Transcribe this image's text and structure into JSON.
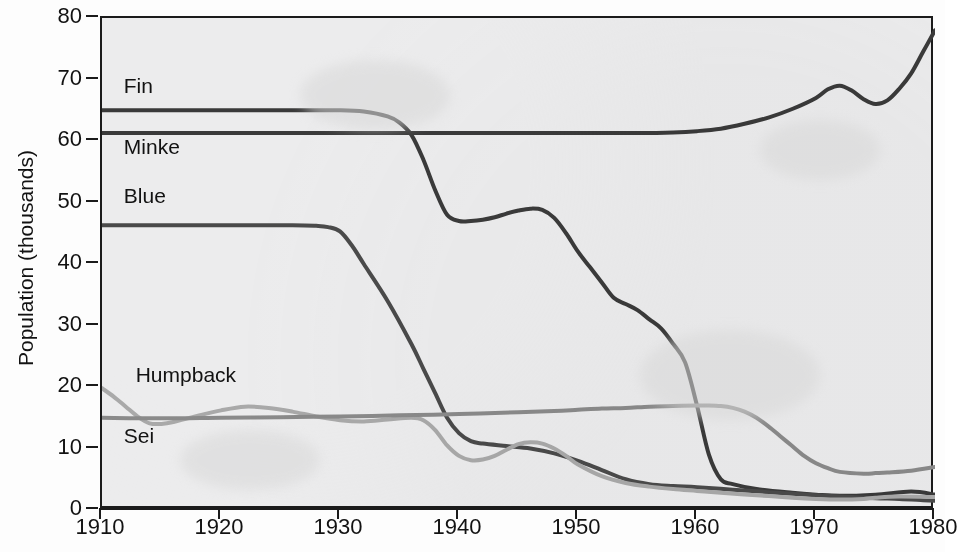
{
  "chart_data": {
    "type": "line",
    "title": "",
    "xlabel": "",
    "ylabel": "Population (thousands)",
    "xlim": [
      1910,
      1980
    ],
    "ylim": [
      0,
      80
    ],
    "xticks": [
      1910,
      1920,
      1930,
      1940,
      1950,
      1960,
      1970,
      1980
    ],
    "yticks": [
      0,
      10,
      20,
      30,
      40,
      50,
      60,
      70,
      80
    ],
    "grid": false,
    "legend": "inline-labels-left",
    "background": "#ececed",
    "series": [
      {
        "name": "Fin",
        "color": "#3a3a3a",
        "label_x": 1912,
        "label_y": 68.5,
        "x": [
          1910,
          1915,
          1920,
          1925,
          1930,
          1932,
          1934,
          1935,
          1936,
          1937,
          1938,
          1939,
          1940,
          1941,
          1942,
          1943,
          1944,
          1945,
          1946,
          1947,
          1948,
          1949,
          1950,
          1951,
          1952,
          1953,
          1954,
          1955,
          1956,
          1957,
          1958,
          1959,
          1960,
          1961,
          1962,
          1963,
          1965,
          1968,
          1970,
          1972,
          1975,
          1978,
          1980
        ],
        "values": [
          65,
          65,
          65,
          65,
          65,
          64.8,
          64,
          63,
          61,
          57,
          52,
          48,
          47,
          47,
          47.2,
          47.6,
          48.2,
          48.7,
          49,
          48.8,
          47.5,
          45,
          42,
          39.5,
          37,
          34.5,
          33.5,
          32.5,
          31,
          29.5,
          27,
          24,
          17,
          9,
          5,
          4.2,
          3.4,
          2.8,
          2.5,
          2.3,
          2.5,
          3,
          2.5
        ]
      },
      {
        "name": "Minke",
        "color": "#3a3a3a",
        "label_x": 1912,
        "label_y": 58.5,
        "x": [
          1910,
          1920,
          1930,
          1940,
          1950,
          1955,
          1958,
          1960,
          1962,
          1964,
          1966,
          1968,
          1970,
          1971,
          1972,
          1973,
          1974,
          1975,
          1976,
          1977,
          1978,
          1979,
          1980
        ],
        "values": [
          61.3,
          61.3,
          61.3,
          61.3,
          61.3,
          61.3,
          61.4,
          61.6,
          62,
          62.8,
          63.8,
          65.2,
          67,
          68.4,
          69,
          68.2,
          66.8,
          66,
          66.6,
          68.5,
          71,
          74.5,
          78
        ]
      },
      {
        "name": "Blue",
        "color": "#4a4a4a",
        "label_x": 1912,
        "label_y": 50.5,
        "x": [
          1910,
          1920,
          1926,
          1928,
          1929,
          1930,
          1931,
          1932,
          1934,
          1936,
          1937,
          1938,
          1939,
          1940,
          1941,
          1942,
          1944,
          1946,
          1948,
          1950,
          1952,
          1954,
          1956,
          1958,
          1960,
          1963,
          1966,
          1970,
          1973,
          1975,
          1977,
          1979,
          1980
        ],
        "values": [
          46.3,
          46.3,
          46.3,
          46.2,
          46,
          45.3,
          43,
          40,
          34,
          27,
          23,
          19,
          15,
          12.5,
          11.2,
          10.8,
          10.4,
          10,
          9.2,
          8,
          6.5,
          5,
          4.2,
          3.9,
          3.7,
          3.3,
          2.9,
          2.4,
          2.1,
          1.9,
          1.8,
          1.6,
          1.5
        ]
      },
      {
        "name": "Humpback",
        "color": "#a9a9a9",
        "label_x": 1913,
        "label_y": 21.5,
        "x": [
          1910,
          1911,
          1912,
          1913,
          1914,
          1915,
          1916,
          1918,
          1920,
          1922,
          1924,
          1926,
          1928,
          1930,
          1932,
          1934,
          1936,
          1937,
          1938,
          1939,
          1940,
          1941,
          1942,
          1943,
          1944,
          1945,
          1946,
          1947,
          1948,
          1949,
          1950,
          1952,
          1954,
          1956,
          1958,
          1960,
          1962,
          1965,
          1968,
          1970,
          1972,
          1974,
          1975,
          1977,
          1980
        ],
        "values": [
          19.8,
          18.4,
          16.8,
          15.2,
          14.1,
          14,
          14.3,
          15.3,
          16.2,
          16.8,
          16.6,
          16,
          15.2,
          14.6,
          14.4,
          14.7,
          15,
          14.6,
          13,
          10.5,
          8.8,
          8.1,
          8.2,
          8.8,
          9.8,
          10.7,
          11,
          10.8,
          10,
          8.8,
          7.4,
          5.5,
          4.4,
          3.8,
          3.4,
          3.1,
          2.8,
          2.4,
          2,
          1.8,
          1.7,
          1.8,
          2,
          2.2,
          2.1
        ]
      },
      {
        "name": "Sei",
        "color": "#8a8a8a",
        "label_x": 1912,
        "label_y": 11.5,
        "x": [
          1910,
          1915,
          1920,
          1925,
          1930,
          1935,
          1940,
          1945,
          1948,
          1950,
          1952,
          1954,
          1956,
          1958,
          1960,
          1961,
          1962,
          1963,
          1964,
          1965,
          1966,
          1967,
          1968,
          1969,
          1970,
          1971,
          1972,
          1974,
          1975,
          1976,
          1978,
          1980
        ],
        "values": [
          15,
          14.9,
          15,
          15.1,
          15.2,
          15.4,
          15.6,
          15.9,
          16.1,
          16.3,
          16.5,
          16.6,
          16.8,
          16.9,
          17,
          17,
          16.9,
          16.6,
          16,
          15,
          13.6,
          12,
          10.4,
          8.8,
          7.6,
          6.8,
          6.2,
          5.9,
          6,
          6.1,
          6.4,
          7
        ]
      }
    ]
  },
  "axis": {
    "y_title": "Population (thousands)"
  }
}
